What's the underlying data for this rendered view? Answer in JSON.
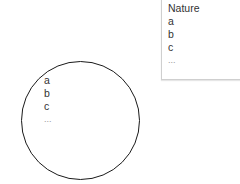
{
  "box": {
    "title": "Nature",
    "items": [
      "a",
      "b",
      "c",
      "..."
    ]
  },
  "circle": {
    "items": [
      "a",
      "b",
      "c",
      "..."
    ]
  }
}
